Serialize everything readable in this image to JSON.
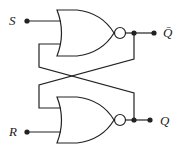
{
  "diagram": {
    "inputs": [
      {
        "label": "S"
      },
      {
        "label": "R"
      }
    ],
    "outputs": [
      {
        "label": "Q̄"
      },
      {
        "label": "Q"
      }
    ],
    "gates": [
      {
        "type": "NOR",
        "position": "top",
        "inputs": [
          "S",
          "Q"
        ],
        "output": "Q̄"
      },
      {
        "type": "NOR",
        "position": "bottom",
        "inputs": [
          "Q̄",
          "R"
        ],
        "output": "Q"
      }
    ],
    "colors": {
      "stroke": "#222222",
      "background": "#ffffff"
    }
  }
}
